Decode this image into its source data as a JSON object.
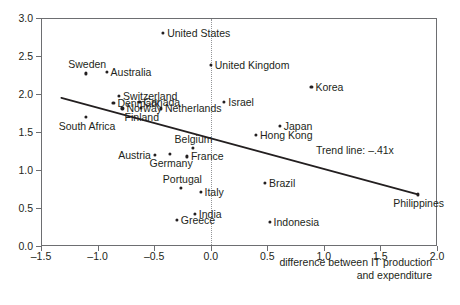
{
  "chart_data": {
    "type": "scatter",
    "title": "",
    "xlabel": "difference between IT production and expenditure",
    "ylabel": "",
    "xlim": [
      -1.5,
      2.0
    ],
    "ylim": [
      0.0,
      3.0
    ],
    "grid": false,
    "legend": null,
    "xticks": [
      "-1.5",
      "-1.0",
      "-0.5",
      "0.0",
      "0.5",
      "1.0",
      "1.5",
      "2.0"
    ],
    "xtick_values": [
      -1.5,
      -1.0,
      -0.5,
      0.0,
      0.5,
      1.0,
      1.5,
      2.0
    ],
    "yticks": [
      "0.0",
      "0.5",
      "1.0",
      "1.5",
      "2.0",
      "2.5",
      "3.0"
    ],
    "ytick_values": [
      0.0,
      0.5,
      1.0,
      1.5,
      2.0,
      2.5,
      3.0
    ],
    "annotations": [
      {
        "name": "zero-reference-line",
        "type": "vertical-dotted-line",
        "x": 0.0
      },
      {
        "name": "trend-line",
        "type": "line",
        "label": "Trend line: –.41x",
        "slope": -0.41,
        "x0": -1.32,
        "y0": 1.95,
        "x1": 1.83,
        "y1": 0.68
      }
    ],
    "points": [
      {
        "label": "United States",
        "x": -0.42,
        "y": 2.8,
        "label_side": "right"
      },
      {
        "label": "United Kingdom",
        "x": 0.0,
        "y": 2.38,
        "label_side": "right"
      },
      {
        "label": "Sweden",
        "x": -1.1,
        "y": 2.27,
        "label_side": "above"
      },
      {
        "label": "Australia",
        "x": -0.92,
        "y": 2.29,
        "label_side": "right"
      },
      {
        "label": "Korea",
        "x": 0.89,
        "y": 2.09,
        "label_side": "right"
      },
      {
        "label": "Switzerland",
        "x": -0.81,
        "y": 1.97,
        "label_side": "right"
      },
      {
        "label": "Denmark",
        "x": -0.86,
        "y": 1.88,
        "label_side": "right"
      },
      {
        "label": "Canada",
        "x": -0.63,
        "y": 1.9,
        "label_side": "right"
      },
      {
        "label": "Israel",
        "x": 0.12,
        "y": 1.9,
        "label_side": "right"
      },
      {
        "label": "Norway",
        "x": -0.78,
        "y": 1.81,
        "label_side": "right"
      },
      {
        "label": "Finland",
        "x": -0.62,
        "y": 1.82,
        "label_side": "below"
      },
      {
        "label": "Netherlands",
        "x": -0.44,
        "y": 1.81,
        "label_side": "right"
      },
      {
        "label": "South Africa",
        "x": -1.1,
        "y": 1.7,
        "label_side": "below"
      },
      {
        "label": "Japan",
        "x": 0.61,
        "y": 1.58,
        "label_side": "right"
      },
      {
        "label": "Hong Kong",
        "x": 0.4,
        "y": 1.46,
        "label_side": "right"
      },
      {
        "label": "Belgium",
        "x": -0.16,
        "y": 1.29,
        "label_side": "above"
      },
      {
        "label": "Austria",
        "x": -0.49,
        "y": 1.2,
        "label_side": "left"
      },
      {
        "label": "Germany",
        "x": -0.36,
        "y": 1.21,
        "label_side": "below"
      },
      {
        "label": "France",
        "x": -0.21,
        "y": 1.18,
        "label_side": "right"
      },
      {
        "label": "Portugal",
        "x": -0.26,
        "y": 0.76,
        "label_side": "above"
      },
      {
        "label": "Italy",
        "x": -0.09,
        "y": 0.71,
        "label_side": "right"
      },
      {
        "label": "Brazil",
        "x": 0.48,
        "y": 0.83,
        "label_side": "right"
      },
      {
        "label": "Philippines",
        "x": 1.83,
        "y": 0.68,
        "label_side": "below"
      },
      {
        "label": "India",
        "x": -0.14,
        "y": 0.42,
        "label_side": "right"
      },
      {
        "label": "Greece",
        "x": -0.3,
        "y": 0.34,
        "label_side": "right"
      },
      {
        "label": "Indonesia",
        "x": 0.52,
        "y": 0.32,
        "label_side": "right"
      }
    ]
  },
  "axis_title_lines": [
    "difference between IT production",
    "and expenditure"
  ]
}
